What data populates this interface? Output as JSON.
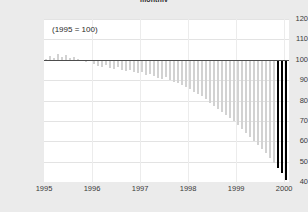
{
  "chart_data": {
    "type": "bar",
    "title": "monthly",
    "xlabel": "",
    "ylabel": "",
    "annotation": "(1995 = 100)",
    "grid": true,
    "legend": "none",
    "ylim": [
      40,
      120
    ],
    "yticks": [
      120,
      110,
      100,
      90,
      80,
      70,
      60,
      50,
      40
    ],
    "xticks": [
      "1995",
      "1996",
      "1997",
      "1998",
      "1999",
      "2000"
    ],
    "xlim": [
      "1995.0",
      "2000.2"
    ],
    "baseline": 100,
    "bar_color": "#d2d2d2",
    "highlight_color": "#000000",
    "highlighted_indices": [
      58,
      59,
      60
    ],
    "x": [
      "1995-01",
      "1995-02",
      "1995-03",
      "1995-04",
      "1995-05",
      "1995-06",
      "1995-07",
      "1995-08",
      "1995-09",
      "1995-10",
      "1995-11",
      "1995-12",
      "1996-01",
      "1996-02",
      "1996-03",
      "1996-04",
      "1996-05",
      "1996-06",
      "1996-07",
      "1996-08",
      "1996-09",
      "1996-10",
      "1996-11",
      "1996-12",
      "1997-01",
      "1997-02",
      "1997-03",
      "1997-04",
      "1997-05",
      "1997-06",
      "1997-07",
      "1997-08",
      "1997-09",
      "1997-10",
      "1997-11",
      "1997-12",
      "1998-01",
      "1998-02",
      "1998-03",
      "1998-04",
      "1998-05",
      "1998-06",
      "1998-07",
      "1998-08",
      "1998-09",
      "1998-10",
      "1998-11",
      "1998-12",
      "1999-01",
      "1999-02",
      "1999-03",
      "1999-04",
      "1999-05",
      "1999-06",
      "1999-07",
      "1999-08",
      "1999-09",
      "1999-10",
      "1999-11",
      "1999-12",
      "2000-01"
    ],
    "values": [
      100.5,
      102.0,
      101.0,
      103.0,
      101.5,
      102.5,
      100.8,
      101.2,
      100.3,
      99.5,
      98.8,
      99.2,
      98.0,
      97.0,
      96.5,
      97.5,
      96.0,
      95.5,
      96.2,
      95.0,
      94.5,
      95.2,
      94.0,
      93.5,
      93.8,
      92.5,
      93.0,
      92.0,
      91.0,
      90.5,
      91.5,
      90.0,
      89.0,
      88.5,
      87.5,
      86.5,
      85.5,
      84.0,
      83.0,
      82.0,
      80.5,
      79.0,
      77.5,
      76.0,
      74.5,
      73.0,
      71.5,
      70.0,
      68.0,
      66.0,
      64.0,
      62.0,
      60.0,
      58.0,
      56.0,
      54.0,
      52.0,
      49.5,
      47.0,
      44.5,
      41.0
    ]
  }
}
